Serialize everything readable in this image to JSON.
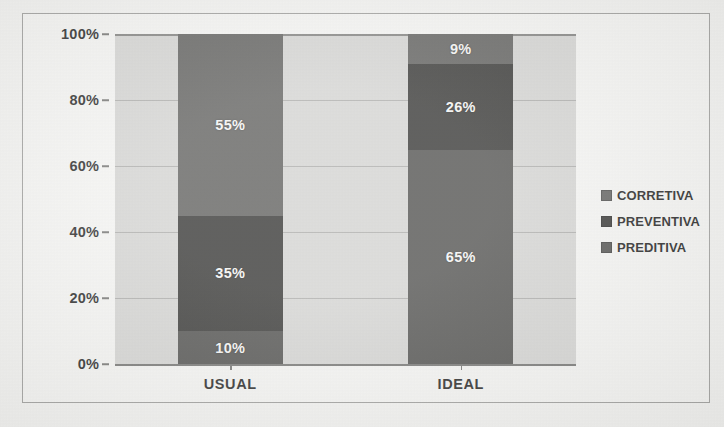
{
  "chart_data": {
    "type": "bar",
    "variant": "stacked-100-percent",
    "title": "",
    "xlabel": "",
    "ylabel": "",
    "categories": [
      "USUAL",
      "IDEAL"
    ],
    "series": [
      {
        "name": "CORRETIVA",
        "values": [
          55,
          9
        ],
        "color": "#5a5a58",
        "labels": [
          "55%",
          "9%"
        ]
      },
      {
        "name": "PREVENTIVA",
        "values": [
          35,
          26
        ],
        "color": "#2e2e2c",
        "labels": [
          "35%",
          "26%"
        ]
      },
      {
        "name": "PREDITIVA",
        "values": [
          10,
          65
        ],
        "color": "#4a4a48",
        "labels": [
          "10%",
          "65%"
        ]
      }
    ],
    "stack_order_bottom_to_top": [
      "PREDITIVA",
      "PREVENTIVA",
      "CORRETIVA"
    ],
    "ylim": [
      0,
      100
    ],
    "ytick_values": [
      0,
      20,
      40,
      60,
      80,
      100
    ],
    "ytick_labels": [
      "0%",
      "20%",
      "40%",
      "60%",
      "80%",
      "100%"
    ],
    "grid": true,
    "legend_position": "right",
    "plot_background": "#d2d2d0",
    "chart_background": "#f4f4f2"
  },
  "legend": {
    "items": [
      {
        "label": "CORRETIVA",
        "color": "#5a5a58"
      },
      {
        "label": "PREVENTIVA",
        "color": "#2e2e2c"
      },
      {
        "label": "PREDITIVA",
        "color": "#4a4a48"
      }
    ]
  }
}
